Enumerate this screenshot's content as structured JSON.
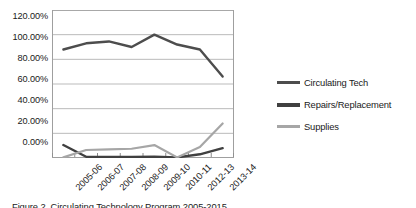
{
  "chart_data": {
    "type": "line",
    "title": "",
    "xlabel": "",
    "ylabel": "",
    "grid": true,
    "legend_position": "right",
    "ylim": [
      0,
      120
    ],
    "ytick_labels": [
      "120.00%",
      "100.00%",
      "80.00%",
      "60.00%",
      "40.00%",
      "20.00%",
      "0.00%"
    ],
    "ytick_values": [
      120,
      100,
      80,
      60,
      40,
      20,
      0
    ],
    "categories": [
      "2005-06",
      "2006-07",
      "2007-08",
      "2008-09",
      "2009-10",
      "2010-11",
      "2012-13",
      "2013-14"
    ],
    "series": [
      {
        "name": "Circulating Tech",
        "color": "#4d4d4d",
        "values": [
          88,
          93,
          94.5,
          90,
          100,
          92,
          88,
          66
        ]
      },
      {
        "name": "Repairs/Replacement",
        "color": "#404040",
        "values": [
          10.5,
          1,
          0.8,
          0.8,
          1,
          0.5,
          3,
          8
        ]
      },
      {
        "name": "Supplies",
        "color": "#a6a6a6",
        "values": [
          0.5,
          6.5,
          7,
          7.5,
          10.5,
          0.5,
          9,
          28
        ]
      }
    ]
  },
  "legend": {
    "items": [
      {
        "label": "Circulating Tech",
        "color": "#4d4d4d"
      },
      {
        "label": "Repairs/Replacement",
        "color": "#404040"
      },
      {
        "label": "Supplies",
        "color": "#a6a6a6"
      }
    ]
  },
  "caption": {
    "text": "Figure 2. Circulating Technology Program 2005-2015"
  },
  "colors": {
    "plot_border": "#9f9f9f",
    "gridline": "#b3b3b3",
    "axis": "#808080",
    "text": "#1a1a1a",
    "background": "#ffffff"
  }
}
